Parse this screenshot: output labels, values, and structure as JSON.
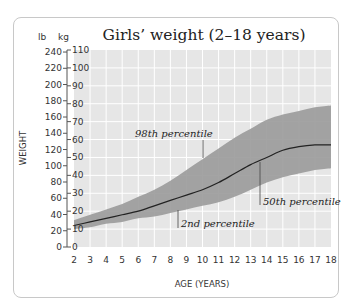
{
  "chart_data": {
    "type": "area",
    "title": "Girls’ weight (2–18 years)",
    "xlabel": "AGE (YEARS)",
    "ylabel": "WEIGHT",
    "y_units": {
      "left": "lb",
      "right": "kg"
    },
    "x": [
      2,
      3,
      4,
      5,
      6,
      7,
      8,
      9,
      10,
      11,
      12,
      13,
      14,
      15,
      16,
      17,
      18
    ],
    "x_ticks": [
      "2",
      "3",
      "4",
      "5",
      "6",
      "7",
      "8",
      "9",
      "10",
      "11",
      "12",
      "13",
      "14",
      "15",
      "16",
      "17",
      "18"
    ],
    "xlim": [
      2,
      18
    ],
    "ylim_kg": [
      0,
      110
    ],
    "y_ticks_lb": [
      "0",
      "20",
      "40",
      "60",
      "80",
      "100",
      "120",
      "140",
      "160",
      "180",
      "200",
      "220",
      "240"
    ],
    "y_ticks_kg": [
      "0",
      "10",
      "20",
      "30",
      "40",
      "50",
      "60",
      "70",
      "80",
      "90",
      "100",
      "110"
    ],
    "grid": true,
    "series": [
      {
        "name": "98th percentile",
        "values": [
          15,
          18,
          21,
          24,
          28,
          32,
          37,
          43,
          49,
          55,
          61,
          66,
          71,
          74,
          76,
          78,
          79
        ]
      },
      {
        "name": "50th percentile",
        "values": [
          12,
          14,
          16,
          18,
          20,
          23,
          26,
          29,
          32,
          36,
          41,
          46,
          50,
          54,
          56,
          57,
          57
        ]
      },
      {
        "name": "2nd percentile",
        "values": [
          10,
          11,
          13,
          14,
          16,
          17,
          19,
          21,
          23,
          25,
          28,
          32,
          36,
          39,
          41,
          43,
          44
        ]
      }
    ],
    "annotations": [
      "98th percentile",
      "50th percentile",
      "2nd percentile"
    ],
    "colors": {
      "band": "#9a9a9a",
      "background": "#e6e6e6",
      "grid": "#ffffff",
      "median_line": "#222222"
    }
  }
}
